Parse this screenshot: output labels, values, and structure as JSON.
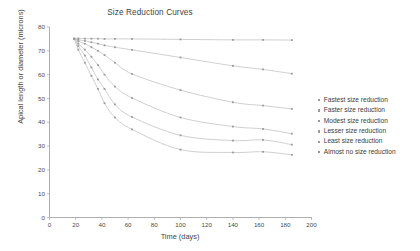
{
  "chart": {
    "title": "Size Reduction Curves",
    "xlabel": "Time (days)",
    "ylabel": "Apical length or diameter (microns)"
  },
  "legend": {
    "items": [
      {
        "label": "Fastest size reduction",
        "marker": "square-marker"
      },
      {
        "label": "Faster size reduction",
        "marker": "square-marker"
      },
      {
        "label": "Modest size reduction",
        "marker": "square-marker"
      },
      {
        "label": "Lesser size reduction",
        "marker": "square-marker"
      },
      {
        "label": "Least size reduction",
        "marker": "square-marker"
      },
      {
        "label": "Almost no size reduction",
        "marker": "square-marker"
      }
    ]
  },
  "chart_data": {
    "type": "line",
    "title": "Size Reduction Curves",
    "xlabel": "Time (days)",
    "ylabel": "Apical length or diameter (microns)",
    "xlim": [
      0,
      200
    ],
    "ylim": [
      0,
      80
    ],
    "xticks": [
      0,
      20,
      40,
      60,
      80,
      100,
      120,
      140,
      160,
      180,
      200
    ],
    "yticks": [
      0,
      10,
      20,
      30,
      40,
      50,
      60,
      70,
      80
    ],
    "grid": false,
    "legend_position": "right",
    "line_color": "#c9c9c9",
    "marker_color": "#9a9a9a",
    "series": [
      {
        "name": "Fastest size reduction",
        "x": [
          19,
          22,
          27,
          32,
          37,
          42,
          50,
          63,
          100,
          140,
          163,
          185
        ],
        "y": [
          75.0,
          70.5,
          65.0,
          59.5,
          54.0,
          48.0,
          42.0,
          37.0,
          28.5,
          27.3,
          27.6,
          26.3
        ]
      },
      {
        "name": "Faster size reduction",
        "x": [
          19,
          22,
          27,
          32,
          37,
          42,
          50,
          63,
          100,
          140,
          163,
          185
        ],
        "y": [
          75.0,
          72.0,
          68.0,
          63.0,
          58.0,
          54.0,
          47.5,
          42.2,
          34.5,
          32.3,
          32.6,
          30.6
        ]
      },
      {
        "name": "Modest size reduction",
        "x": [
          19,
          22,
          27,
          32,
          37,
          42,
          50,
          63,
          100,
          140,
          163,
          185
        ],
        "y": [
          75.0,
          73.0,
          70.5,
          67.5,
          64.0,
          60.0,
          55.0,
          50.2,
          42.0,
          38.2,
          37.2,
          35.2
        ]
      },
      {
        "name": "Lesser size reduction",
        "x": [
          19,
          22,
          27,
          32,
          37,
          42,
          50,
          63,
          100,
          140,
          163,
          185
        ],
        "y": [
          75.0,
          74.0,
          73.0,
          71.5,
          70.0,
          68.2,
          65.0,
          60.3,
          53.5,
          48.4,
          47.0,
          45.6
        ]
      },
      {
        "name": "Least size reduction",
        "x": [
          19,
          22,
          27,
          32,
          37,
          42,
          50,
          63,
          100,
          140,
          163,
          185
        ],
        "y": [
          75.0,
          74.6,
          74.2,
          73.6,
          73.0,
          72.3,
          71.5,
          70.4,
          67.2,
          63.7,
          62.2,
          60.4
        ]
      },
      {
        "name": "Almost no size reduction",
        "x": [
          19,
          22,
          27,
          32,
          37,
          42,
          50,
          63,
          100,
          140,
          163,
          185
        ],
        "y": [
          75.2,
          75.2,
          75.1,
          75.1,
          75.1,
          75.0,
          75.0,
          75.0,
          74.8,
          74.6,
          74.6,
          74.5
        ]
      }
    ]
  }
}
